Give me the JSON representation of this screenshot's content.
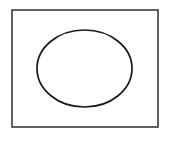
{
  "figure": {
    "title": "Ellipse inscribed in rectangle",
    "type": "line-drawing",
    "canvas": {
      "width": 174,
      "height": 142,
      "background_color": "#fefefe"
    },
    "shapes": [
      {
        "name": "outer-rectangle",
        "shape": "rectangle",
        "x": 12,
        "y": 10,
        "width": 146,
        "height": 117,
        "stroke_color": "#3a3a3a",
        "stroke_width": 1.6,
        "fill": "none"
      },
      {
        "name": "inner-ellipse",
        "shape": "ellipse",
        "center_x": 84.5,
        "center_y": 68.5,
        "radius_x": 47.5,
        "radius_y": 38.5,
        "stroke_color": "#1a1a1a",
        "stroke_width": 1.7,
        "fill": "none"
      }
    ],
    "labels": [],
    "annotations": []
  }
}
